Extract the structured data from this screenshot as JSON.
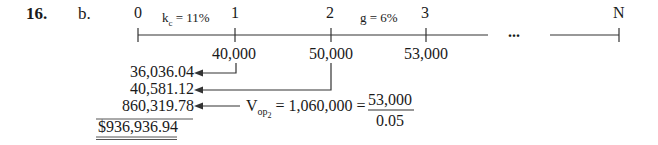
{
  "problem": {
    "number": "16.",
    "part": "b."
  },
  "timeline": {
    "periods": [
      "0",
      "1",
      "2",
      "3",
      "N"
    ],
    "ellipsis": "...",
    "rate_label_kc": "k",
    "rate_label_kc_sub": "c",
    "rate_label_kc_value": " = 11%",
    "rate_label_g": "g = 6%",
    "cash_flows": [
      "40,000",
      "50,000",
      "53,000"
    ]
  },
  "present_values": {
    "items": [
      "36,036.04",
      "40,581.12",
      "860,319.78"
    ],
    "total": "$936,936.94"
  },
  "terminal_value": {
    "label": "V",
    "subscript": "op",
    "subsubscript": "2",
    "equation": " = 1,060,000 = ",
    "numerator": "53,000",
    "denominator": "0.05"
  }
}
